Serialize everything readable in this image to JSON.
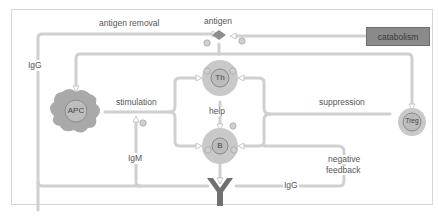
{
  "diagram": {
    "labels": {
      "antigen": "antigen",
      "antigen_removal": "antigen removal",
      "catabolism": "catabolism",
      "igg_left": "IgG",
      "stimulation": "stimulation",
      "help": "help",
      "suppression": "suppression",
      "igm": "IgM",
      "negative_feedback_line1": "negative",
      "negative_feedback_line2": "feedback",
      "igg_bottom": "IgG"
    },
    "cells": {
      "apc": "APC",
      "th": "Th",
      "b": "B",
      "treg": "Treg"
    },
    "signs": {
      "plus": "+",
      "minus": "−"
    },
    "colors": {
      "cell_fill": "#c4c4c4",
      "cell_inner": "#b0b0b0",
      "arrow": "#cfcfcf",
      "antibody": "#707070",
      "catabolism_box": "#8a8a8a",
      "text": "#555555"
    }
  }
}
